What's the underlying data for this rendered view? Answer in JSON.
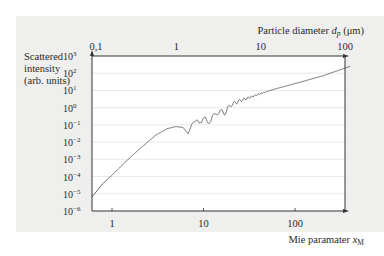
{
  "chart_data": {
    "type": "line",
    "title": "",
    "ylabel": "Scattered intensity (arb. units)",
    "ylabel_lines": [
      "Scattered",
      "intensity",
      "(arb. units)"
    ],
    "xlabel": "Mie paramater x_M",
    "xlabel_text": "Mie paramater ",
    "xlabel_symbol": "x",
    "xlabel_sub": "M",
    "x2label": "Particle diameter d_p (μm)",
    "x2label_text": "Particle diameter ",
    "x2label_symbol": "d",
    "x2label_sub": "p",
    "x2label_unit": " (μm)",
    "xscale": "log",
    "yscale": "log",
    "xlim": [
      0.4,
      500
    ],
    "ylim": [
      1e-06,
      1000.0
    ],
    "x_ticks": [
      {
        "value": 1,
        "label": "1"
      },
      {
        "value": 10,
        "label": "10"
      },
      {
        "value": 100,
        "label": "100"
      }
    ],
    "x2_ticks": [
      {
        "value": 0.1,
        "label": "0,1"
      },
      {
        "value": 1,
        "label": "1"
      },
      {
        "value": 10,
        "label": "10"
      },
      {
        "value": 100,
        "label": "100"
      }
    ],
    "y_ticks": [
      {
        "exp": 3,
        "label": "10",
        "sup": "3"
      },
      {
        "exp": 2,
        "label": "10",
        "sup": "2"
      },
      {
        "exp": 1,
        "label": "10",
        "sup": "1"
      },
      {
        "exp": 0,
        "label": "10",
        "sup": "0"
      },
      {
        "exp": -1,
        "label": "10",
        "sup": "−1"
      },
      {
        "exp": -2,
        "label": "10",
        "sup": "−2"
      },
      {
        "exp": -3,
        "label": "10",
        "sup": "−3"
      },
      {
        "exp": -4,
        "label": "10",
        "sup": "−4"
      },
      {
        "exp": -5,
        "label": "10",
        "sup": "−5"
      },
      {
        "exp": -6,
        "label": "10",
        "sup": "−6"
      }
    ],
    "grid": {
      "horizontal": true,
      "vertical": false
    },
    "series": [
      {
        "name": "Mie scattering intensity",
        "x": [
          0.4,
          0.6,
          1.0,
          1.5,
          2.0,
          3.0,
          4.0,
          5.0,
          6.0,
          6.8,
          7.5,
          8.5,
          9.5,
          10.5,
          12,
          14,
          17,
          20,
          25,
          30,
          40,
          60,
          100,
          200,
          400
        ],
        "y": [
          1e-06,
          1e-05,
          0.00012,
          0.001,
          0.004,
          0.025,
          0.06,
          0.08,
          0.07,
          0.03,
          0.12,
          0.2,
          0.08,
          0.3,
          0.15,
          0.6,
          0.5,
          1.5,
          2.5,
          3.5,
          6,
          12,
          25,
          70,
          250
        ],
        "notes": "Rayleigh regime (~x^4) rises to a broad maximum near x≈5, then oscillating Mie resonances from ~7 to ~40 before smooth power-law growth to the upper right corner"
      }
    ]
  }
}
